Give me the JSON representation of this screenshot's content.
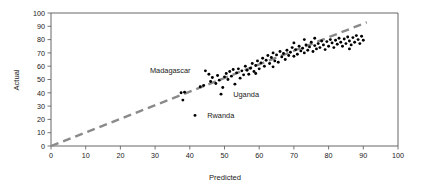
{
  "chart_data": {
    "type": "scatter",
    "title": "",
    "xlabel": "Predicted",
    "ylabel": "Actual",
    "xlim": [
      0,
      100
    ],
    "ylim": [
      0,
      100
    ],
    "xticks": [
      0,
      10,
      20,
      30,
      40,
      50,
      60,
      70,
      80,
      90,
      100
    ],
    "yticks": [
      0,
      10,
      20,
      30,
      40,
      50,
      60,
      70,
      80,
      90,
      100
    ],
    "grid": false,
    "legend": "none",
    "marker_color": "#000000",
    "reference_line": {
      "name": "identity-line",
      "style": "dashed",
      "color": "#8a8a8a",
      "x": [
        0,
        91
      ],
      "y": [
        0,
        93
      ]
    },
    "points": [
      {
        "x": 37.5,
        "y": 40.0
      },
      {
        "x": 38.5,
        "y": 40.5
      },
      {
        "x": 38.0,
        "y": 34.5
      },
      {
        "x": 41.5,
        "y": 23.0
      },
      {
        "x": 43.0,
        "y": 44.5
      },
      {
        "x": 44.0,
        "y": 45.5
      },
      {
        "x": 45.5,
        "y": 54.0
      },
      {
        "x": 46.0,
        "y": 48.5
      },
      {
        "x": 46.5,
        "y": 51.5
      },
      {
        "x": 47.5,
        "y": 47.0
      },
      {
        "x": 48.0,
        "y": 53.0
      },
      {
        "x": 48.5,
        "y": 49.5
      },
      {
        "x": 49.0,
        "y": 39.0
      },
      {
        "x": 50.0,
        "y": 52.0
      },
      {
        "x": 50.5,
        "y": 54.5
      },
      {
        "x": 51.0,
        "y": 50.0
      },
      {
        "x": 51.5,
        "y": 56.0
      },
      {
        "x": 52.0,
        "y": 52.5
      },
      {
        "x": 53.0,
        "y": 46.5
      },
      {
        "x": 53.5,
        "y": 55.0
      },
      {
        "x": 54.0,
        "y": 58.0
      },
      {
        "x": 54.5,
        "y": 51.0
      },
      {
        "x": 55.0,
        "y": 56.5
      },
      {
        "x": 55.5,
        "y": 53.5
      },
      {
        "x": 56.0,
        "y": 60.0
      },
      {
        "x": 56.5,
        "y": 57.0
      },
      {
        "x": 57.0,
        "y": 54.0
      },
      {
        "x": 57.5,
        "y": 58.5
      },
      {
        "x": 58.0,
        "y": 62.0
      },
      {
        "x": 58.5,
        "y": 56.0
      },
      {
        "x": 59.0,
        "y": 60.5
      },
      {
        "x": 59.5,
        "y": 64.0
      },
      {
        "x": 60.0,
        "y": 58.0
      },
      {
        "x": 60.5,
        "y": 62.5
      },
      {
        "x": 61.0,
        "y": 66.0
      },
      {
        "x": 61.5,
        "y": 60.0
      },
      {
        "x": 62.0,
        "y": 64.5
      },
      {
        "x": 62.5,
        "y": 68.0
      },
      {
        "x": 63.0,
        "y": 62.0
      },
      {
        "x": 63.5,
        "y": 66.5
      },
      {
        "x": 64.0,
        "y": 70.0
      },
      {
        "x": 64.5,
        "y": 64.0
      },
      {
        "x": 65.0,
        "y": 68.5
      },
      {
        "x": 65.5,
        "y": 63.0
      },
      {
        "x": 66.0,
        "y": 71.0
      },
      {
        "x": 66.5,
        "y": 67.0
      },
      {
        "x": 67.0,
        "y": 69.5
      },
      {
        "x": 67.5,
        "y": 65.0
      },
      {
        "x": 68.0,
        "y": 72.0
      },
      {
        "x": 68.5,
        "y": 68.0
      },
      {
        "x": 69.0,
        "y": 70.5
      },
      {
        "x": 69.5,
        "y": 74.0
      },
      {
        "x": 70.0,
        "y": 67.5
      },
      {
        "x": 70.5,
        "y": 72.5
      },
      {
        "x": 71.0,
        "y": 69.0
      },
      {
        "x": 71.5,
        "y": 75.0
      },
      {
        "x": 72.0,
        "y": 71.5
      },
      {
        "x": 72.5,
        "y": 73.5
      },
      {
        "x": 73.0,
        "y": 70.0
      },
      {
        "x": 73.5,
        "y": 76.0
      },
      {
        "x": 74.0,
        "y": 72.0
      },
      {
        "x": 74.5,
        "y": 74.5
      },
      {
        "x": 75.0,
        "y": 78.0
      },
      {
        "x": 75.5,
        "y": 71.0
      },
      {
        "x": 76.0,
        "y": 75.5
      },
      {
        "x": 76.5,
        "y": 73.0
      },
      {
        "x": 77.0,
        "y": 77.0
      },
      {
        "x": 77.5,
        "y": 74.0
      },
      {
        "x": 78.0,
        "y": 79.0
      },
      {
        "x": 78.5,
        "y": 76.0
      },
      {
        "x": 79.0,
        "y": 72.5
      },
      {
        "x": 79.5,
        "y": 78.5
      },
      {
        "x": 80.0,
        "y": 75.0
      },
      {
        "x": 80.5,
        "y": 80.0
      },
      {
        "x": 81.0,
        "y": 77.5
      },
      {
        "x": 81.5,
        "y": 74.0
      },
      {
        "x": 82.0,
        "y": 79.5
      },
      {
        "x": 82.5,
        "y": 76.5
      },
      {
        "x": 83.0,
        "y": 81.0
      },
      {
        "x": 83.5,
        "y": 78.0
      },
      {
        "x": 84.0,
        "y": 75.0
      },
      {
        "x": 84.5,
        "y": 80.5
      },
      {
        "x": 85.0,
        "y": 77.0
      },
      {
        "x": 85.5,
        "y": 82.0
      },
      {
        "x": 86.0,
        "y": 79.0
      },
      {
        "x": 86.5,
        "y": 76.0
      },
      {
        "x": 87.0,
        "y": 81.5
      },
      {
        "x": 87.5,
        "y": 78.0
      },
      {
        "x": 88.0,
        "y": 83.0
      },
      {
        "x": 88.5,
        "y": 80.0
      },
      {
        "x": 89.0,
        "y": 77.0
      },
      {
        "x": 89.5,
        "y": 82.5
      },
      {
        "x": 90.0,
        "y": 79.5
      },
      {
        "x": 44.5,
        "y": 56.5
      },
      {
        "x": 49.5,
        "y": 44.0
      },
      {
        "x": 52.5,
        "y": 57.5
      },
      {
        "x": 59.0,
        "y": 54.5
      },
      {
        "x": 64.0,
        "y": 59.5
      },
      {
        "x": 70.0,
        "y": 77.5
      },
      {
        "x": 73.0,
        "y": 80.0
      },
      {
        "x": 76.0,
        "y": 81.0
      },
      {
        "x": 86.0,
        "y": 73.0
      }
    ],
    "annotations": [
      {
        "name": "madagascar-label",
        "text": "Madagascar",
        "x": 45.5,
        "y": 54.0,
        "label_x": 28.5,
        "label_y": 56.5
      },
      {
        "name": "uganda-label",
        "text": "Uganda",
        "x": 49.0,
        "y": 39.0,
        "label_x": 52.5,
        "label_y": 39.0
      },
      {
        "name": "rwanda-label",
        "text": "Rwanda",
        "x": 41.5,
        "y": 23.0,
        "label_x": 45.0,
        "label_y": 23.0
      }
    ]
  },
  "figure": {
    "xlabel": "Predicted",
    "ylabel": "Actual",
    "xtick_labels": [
      "0",
      "10",
      "20",
      "30",
      "40",
      "50",
      "60",
      "70",
      "80",
      "90",
      "100"
    ],
    "ytick_labels": [
      "0",
      "10",
      "20",
      "30",
      "40",
      "50",
      "60",
      "70",
      "80",
      "90",
      "100"
    ]
  }
}
